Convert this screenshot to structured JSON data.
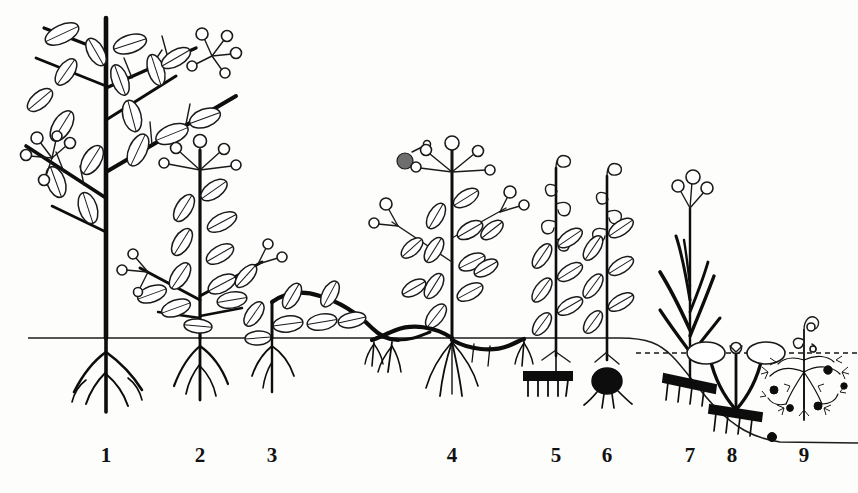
{
  "figure": {
    "kind": "botanical-line-drawing",
    "caption_numbers": [
      "1",
      "2",
      "3",
      "4",
      "5",
      "6",
      "7",
      "8",
      "9"
    ],
    "background_color": "#fdfdfc",
    "ink_color": "#141414"
  },
  "ground": {
    "surface_label": "soil-surface-line",
    "water_label": "water-surface-line"
  },
  "labels": [
    {
      "id": "label-1",
      "text": "1",
      "x": 106,
      "y": 462
    },
    {
      "id": "label-2",
      "text": "2",
      "x": 200,
      "y": 462
    },
    {
      "id": "label-3",
      "text": "3",
      "x": 272,
      "y": 462
    },
    {
      "id": "label-4",
      "text": "4",
      "x": 452,
      "y": 462
    },
    {
      "id": "label-5",
      "text": "5",
      "x": 556,
      "y": 462
    },
    {
      "id": "label-6",
      "text": "6",
      "x": 607,
      "y": 462
    },
    {
      "id": "label-7",
      "text": "7",
      "x": 690,
      "y": 462
    },
    {
      "id": "label-8",
      "text": "8",
      "x": 732,
      "y": 462
    },
    {
      "id": "label-9",
      "text": "9",
      "x": 804,
      "y": 462
    }
  ],
  "plants": [
    {
      "number": "1",
      "name": "tall-tree",
      "center_x": 106
    },
    {
      "number": "2",
      "name": "shrub",
      "center_x": 200
    },
    {
      "number": "3",
      "name": "creeping-dwarf-shrub",
      "center_x": 285
    },
    {
      "number": "4",
      "name": "rosette-stolon-herb",
      "center_x": 452
    },
    {
      "number": "5",
      "name": "rhizome-geophyte",
      "center_x": 556
    },
    {
      "number": "6",
      "name": "bulb-geophyte",
      "center_x": 607
    },
    {
      "number": "7",
      "name": "grass-rhizome-geophyte",
      "center_x": 690
    },
    {
      "number": "8",
      "name": "floating-leaf-hydrophyte",
      "center_x": 735
    },
    {
      "number": "9",
      "name": "submerged-hydrophyte",
      "center_x": 804
    }
  ]
}
